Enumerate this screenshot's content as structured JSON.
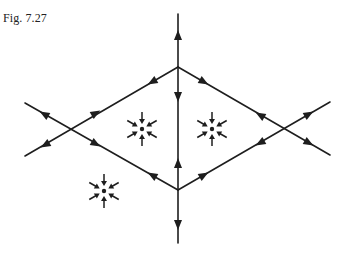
{
  "figure": {
    "caption": "Fig. 7.27"
  },
  "colors": {
    "ink": "#1e1e1e",
    "background": "#ffffff"
  },
  "diagram": {
    "saddles": [
      {
        "name": "top",
        "x": 178,
        "y": 67
      },
      {
        "name": "bottom",
        "x": 178,
        "y": 190
      },
      {
        "name": "left",
        "x": 68,
        "y": 129
      },
      {
        "name": "right",
        "x": 285,
        "y": 129
      }
    ],
    "sinks": [
      {
        "name": "left-inner",
        "x": 142,
        "y": 129
      },
      {
        "name": "right-inner",
        "x": 212,
        "y": 129
      },
      {
        "name": "outer-lower-left",
        "x": 104,
        "y": 191
      }
    ]
  }
}
